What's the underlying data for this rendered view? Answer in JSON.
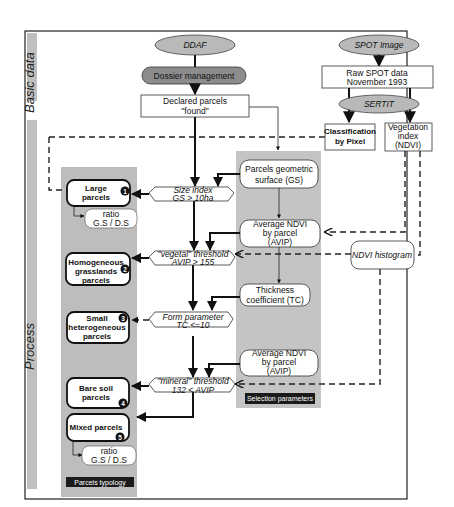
{
  "sections": {
    "basic": "Basic data",
    "process": "Process"
  },
  "sources": {
    "ddaf": "DDAF",
    "spot_image": "SPOT Image",
    "dossier": "Dossier management",
    "sertit": "SERTIT"
  },
  "data_boxes": {
    "declared_line1": "Declared parcels",
    "declared_line2": "\"found\"",
    "raw_line1": "Raw SPOT data",
    "raw_line2": "November 1993",
    "classif_line1": "Classification",
    "classif_line2": "by Pixel",
    "veg_line1": "Vegetation",
    "veg_line2": "index",
    "veg_line3": "(NDVI)"
  },
  "selection_parameters": {
    "label": "Selection parameters",
    "gs_line1": "Parcels geometric",
    "gs_line2": "surface (GS)",
    "avip1_line1": "Average NDVI",
    "avip1_line2": "by parcel",
    "avip1_line3": "(AVIP)",
    "tc_line1": "Thickness",
    "tc_line2": "coefficient (TC)",
    "avip2_line1": "Average NDVI",
    "avip2_line2": "by parcel",
    "avip2_line3": "(AVIP)"
  },
  "ndvi_histogram": "NDVI histogram",
  "tests": [
    {
      "line1": "Size index",
      "line2": "GS > 10ha"
    },
    {
      "line1": "\"vegetal\" threshold",
      "line2": "AVIP > 155"
    },
    {
      "line1": "Form parameter",
      "line2": "TC <=10"
    },
    {
      "line1": "\"mineral\" threshold",
      "line2": "132 < AVIP"
    }
  ],
  "typology": {
    "label": "Parcels typology",
    "items": [
      {
        "num": "1",
        "line1": "Large",
        "line2": "parcels",
        "line3": ""
      },
      {
        "num": "2",
        "line1": "Homogeneous",
        "line2": "grasslands",
        "line3": "parcels"
      },
      {
        "num": "3",
        "line1": "Small",
        "line2": "heterogeneous",
        "line3": "parcels"
      },
      {
        "num": "4",
        "line1": "Bare soil",
        "line2": "parcels",
        "line3": ""
      },
      {
        "num": "5",
        "line1": "Mixed parcels",
        "line2": "",
        "line3": ""
      }
    ],
    "ratio1_line1": "ratio",
    "ratio1_line2": "G.S / D.S",
    "ratio2_line1": "ratio",
    "ratio2_line2": "G.S / D.S"
  }
}
